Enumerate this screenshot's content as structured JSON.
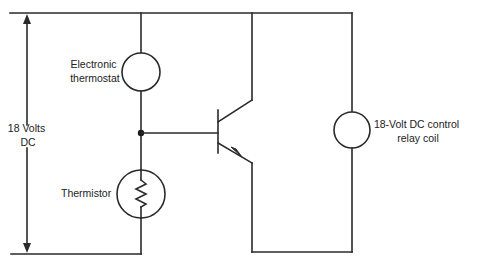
{
  "diagram": {
    "type": "circuit-schematic",
    "background": "#ffffff",
    "line_color": "#2a2a2a",
    "supply": {
      "label_line1": "18 Volts",
      "label_line2": "DC"
    },
    "components": {
      "thermostat": {
        "icon": "circle-load-icon",
        "label_line1": "Electronic",
        "label_line2": "thermostat"
      },
      "thermistor": {
        "icon": "resistor-in-circle-icon",
        "label": "Thermistor"
      },
      "transistor": {
        "icon": "npn-transistor-icon"
      },
      "relay_coil": {
        "icon": "circle-load-icon",
        "label_line1": "18-Volt DC control",
        "label_line2": "relay coil"
      }
    }
  }
}
